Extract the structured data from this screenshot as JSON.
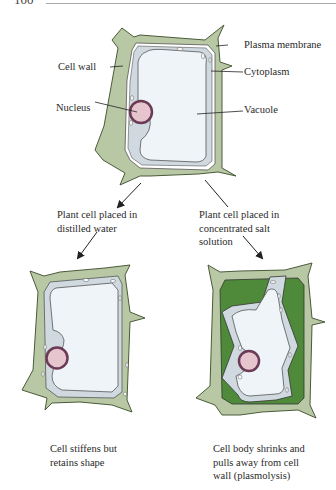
{
  "page": {
    "number": "100"
  },
  "colors": {
    "cell_wall": "#b9c8a4",
    "cell_wall_stroke": "#4a5a3a",
    "cytoplasm": "#cfd9df",
    "vacuole": "#eef4f8",
    "nucleus_fill": "#e7c5cf",
    "nucleus_ring": "#6b3a55",
    "plasmolysis_space": "#4f8a3a"
  },
  "top_cell": {
    "labels": {
      "plasma_membrane": "Plasma membrane",
      "cell_wall": "Cell wall",
      "cytoplasm": "Cytoplasm",
      "nucleus": "Nucleus",
      "vacuole": "Vacuole"
    }
  },
  "branches": {
    "left": {
      "condition": [
        "Plant cell placed in",
        "distilled water"
      ],
      "result": [
        "Cell stiffens but",
        "retains shape"
      ]
    },
    "right": {
      "condition": [
        "Plant cell placed in",
        "concentrated salt",
        "solution"
      ],
      "result": [
        "Cell body shrinks and",
        "pulls away from cell",
        "wall (plasmolysis)"
      ]
    }
  }
}
